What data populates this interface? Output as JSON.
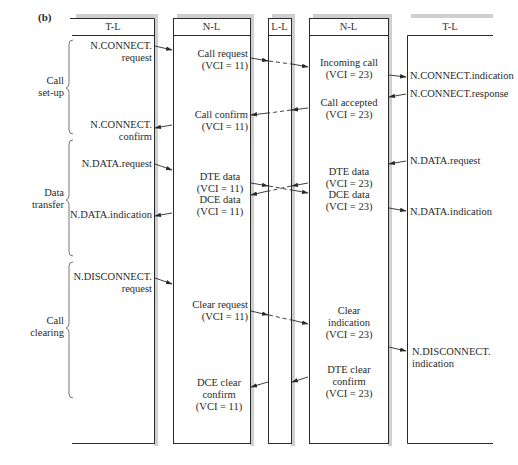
{
  "figure": {
    "label": "(b)"
  },
  "columns": [
    {
      "id": "tl-left",
      "header": "T-L"
    },
    {
      "id": "nl-left",
      "header": "N-L"
    },
    {
      "id": "ll",
      "header": "L-L"
    },
    {
      "id": "nl-right",
      "header": "N-L"
    },
    {
      "id": "tl-right",
      "header": "T-L"
    }
  ],
  "phases": [
    {
      "id": "setup",
      "label_line1": "Call",
      "label_line2": "set-up"
    },
    {
      "id": "data",
      "label_line1": "Data",
      "label_line2": "transfer"
    },
    {
      "id": "clearing",
      "label_line1": "Call",
      "label_line2": "clearing"
    }
  ],
  "left_tl": {
    "connect_request": [
      "N.CONNECT.",
      "request"
    ],
    "connect_confirm": [
      "N.CONNECT.",
      "confirm"
    ],
    "data_request": "N.DATA.request",
    "data_indication": "N.DATA.indication",
    "disconnect_request": [
      "N.DISCONNECT.",
      "request"
    ]
  },
  "left_nl": {
    "call_request": [
      "Call request",
      "(VCI = 11)"
    ],
    "call_confirm": [
      "Call confirm",
      "(VCI = 11)"
    ],
    "dte_data": [
      "DTE data",
      "(VCI = 11)"
    ],
    "dce_data": [
      "DCE data",
      "(VCI = 11)"
    ],
    "clear_request": [
      "Clear request",
      "(VCI = 11)"
    ],
    "dce_clear_confirm": [
      "DCE clear",
      "confirm",
      "(VCI = 11)"
    ]
  },
  "right_nl": {
    "incoming_call": [
      "Incoming call",
      "(VCI = 23)"
    ],
    "call_accepted": [
      "Call accepted",
      "(VCI = 23)"
    ],
    "dte_data": [
      "DTE data",
      "(VCI = 23)"
    ],
    "dce_data": [
      "DCE data",
      "(VCI = 23)"
    ],
    "clear_indication": [
      "Clear",
      "indication",
      "(VCI = 23)"
    ],
    "dte_clear_confirm": [
      "DTE clear",
      "confirm",
      "(VCI = 23)"
    ]
  },
  "right_tl": {
    "connect_indication": "N.CONNECT.indication",
    "connect_response": "N.CONNECT.response",
    "data_request": "N.DATA.request",
    "data_indication": "N.DATA.indication",
    "disconnect_indication": [
      "N.DISCONNECT.",
      "indication"
    ]
  },
  "colors": {
    "line": "#2a2a2a",
    "shadow": "#c8c8c8",
    "text": "#2a2a2a"
  }
}
